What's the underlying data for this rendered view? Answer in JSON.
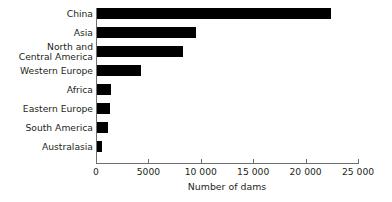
{
  "chart_data": {
    "type": "bar",
    "orientation": "horizontal",
    "title": "",
    "xlabel": "Number of dams",
    "ylabel": "",
    "categories": [
      "China",
      "Asia",
      "North and\nCentral America",
      "Western Europe",
      "Africa",
      "Eastern Europe",
      "South America",
      "Australasia"
    ],
    "values": [
      22400,
      9500,
      8300,
      4300,
      1400,
      1300,
      1100,
      600
    ],
    "xlim": [
      0,
      25000
    ],
    "xticks": [
      0,
      5000,
      10000,
      15000,
      20000,
      25000
    ],
    "xticklabels": [
      "0",
      "5000",
      "10 000",
      "15 000",
      "20 000",
      "25 000"
    ],
    "grid": false,
    "legend": false,
    "bar_color": "#000000",
    "axis_color": "#6f6f6f",
    "text_color": "#231f20"
  }
}
